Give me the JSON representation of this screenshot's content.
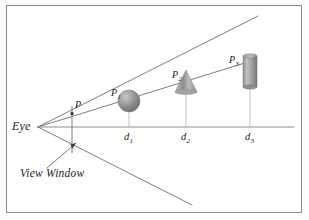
{
  "figure": {
    "title_alt": "Perspective projection: eye, view window and three objects at increasing depths",
    "background_color": "#fdfdfc",
    "frame_color": "#8a8a8a",
    "line_color": "#6e6e6e",
    "text_color": "#1c1c1c",
    "object_fill": "#9a9a9a"
  },
  "labels": {
    "eye": "Eye",
    "view_window": "View Window",
    "point_p": "P",
    "point_p1_base": "P",
    "point_p1_sub": "1",
    "point_p2_base": "P",
    "point_p2_sub": "2",
    "point_p3_base": "P",
    "point_p3_sub": "3",
    "d1_base": "d",
    "d1_sub": "1",
    "d2_base": "d",
    "d2_sub": "2",
    "d3_base": "d",
    "d3_sub": "3"
  },
  "geometry": {
    "eye_point": [
      38,
      127
    ],
    "view_window": {
      "x": 72,
      "top_y": 107,
      "bottom_y": 152
    },
    "rays": [
      {
        "name": "upper-frustum-ray",
        "from": [
          38,
          127
        ],
        "to": [
          258,
          16
        ]
      },
      {
        "name": "object-sight-ray",
        "from": [
          38,
          127
        ],
        "to": [
          248,
          62
        ]
      },
      {
        "name": "horizon-axis-ray",
        "from": [
          38,
          127
        ],
        "to": [
          294,
          127
        ]
      },
      {
        "name": "lower-frustum-ray",
        "from": [
          38,
          127
        ],
        "to": [
          192,
          205
        ]
      }
    ],
    "leader_line": {
      "from": [
        52,
        163
      ],
      "to": [
        78,
        141
      ]
    },
    "objects": [
      {
        "name": "sphere",
        "label": "P1",
        "center": [
          129,
          101
        ],
        "radius": 11,
        "depth_label": "d1",
        "depth_x": 129
      },
      {
        "name": "cone",
        "label": "P2",
        "apex": [
          186,
          71
        ],
        "base_y": 92,
        "half_width": 11,
        "depth_label": "d2",
        "depth_x": 186
      },
      {
        "name": "cylinder",
        "label": "P3",
        "left": 243,
        "top": 54,
        "width": 14,
        "height": 33,
        "depth_label": "d3",
        "depth_x": 250
      }
    ],
    "drop_lines": [
      {
        "name": "drop-line-d1",
        "x": 129,
        "from_y": 112,
        "to_y": 127
      },
      {
        "name": "drop-line-d2",
        "x": 186,
        "from_y": 92,
        "to_y": 127
      },
      {
        "name": "drop-line-d3",
        "x": 250,
        "from_y": 87,
        "to_y": 127
      }
    ]
  }
}
